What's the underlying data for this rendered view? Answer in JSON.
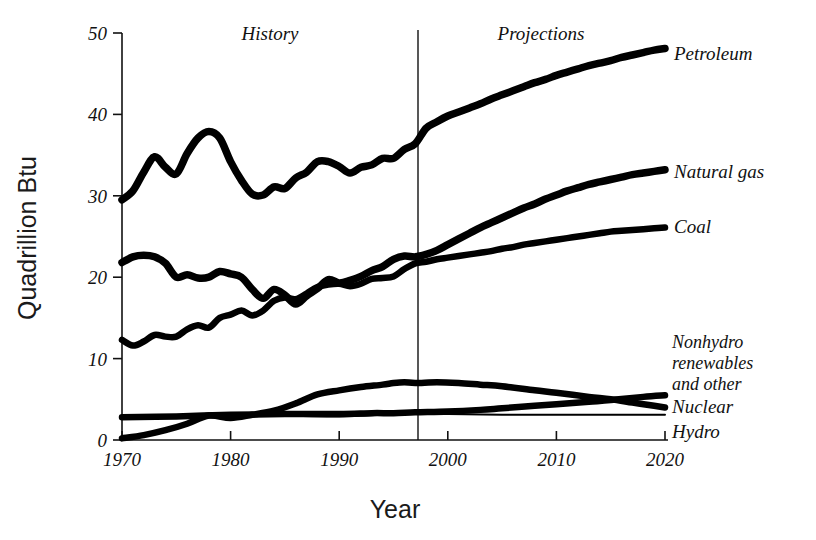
{
  "chart_data": {
    "type": "line",
    "title": "",
    "xlabel": "Year",
    "ylabel": "Quadrillion Btu",
    "xlim": [
      1970,
      2020
    ],
    "ylim": [
      0,
      50
    ],
    "xticks": [
      1970,
      1980,
      1990,
      2000,
      2010,
      2020
    ],
    "yticks": [
      0,
      10,
      20,
      30,
      40,
      50
    ],
    "xtick_labels": [
      "1970",
      "1980",
      "1990",
      "2000",
      "2010",
      "2020"
    ],
    "ytick_labels": [
      "0",
      "10",
      "20",
      "30",
      "40",
      "50"
    ],
    "grid": false,
    "legend_position": "right-inline",
    "annotations": [
      {
        "text": "History",
        "x": 1981,
        "y": 49.5
      },
      {
        "text": "Projections",
        "x": 2006,
        "y": 49.5
      }
    ],
    "divider_x": 1997,
    "series": [
      {
        "name": "Petroleum",
        "label": "Petroleum",
        "x": [
          1970,
          1971,
          1972,
          1973,
          1974,
          1975,
          1976,
          1977,
          1978,
          1979,
          1980,
          1981,
          1982,
          1983,
          1984,
          1985,
          1986,
          1987,
          1988,
          1989,
          1990,
          1991,
          1992,
          1993,
          1994,
          1995,
          1996,
          1997,
          1998,
          1999,
          2000,
          2001,
          2002,
          2003,
          2004,
          2005,
          2006,
          2007,
          2008,
          2009,
          2010,
          2011,
          2012,
          2013,
          2014,
          2015,
          2016,
          2017,
          2018,
          2019,
          2020
        ],
        "values": [
          29.5,
          30.6,
          32.9,
          34.8,
          33.5,
          32.7,
          35.2,
          37.1,
          37.9,
          37.1,
          34.2,
          31.9,
          30.2,
          30.1,
          31.1,
          30.9,
          32.2,
          32.9,
          34.2,
          34.2,
          33.6,
          32.8,
          33.5,
          33.8,
          34.6,
          34.6,
          35.7,
          36.4,
          38.3,
          39.1,
          39.8,
          40.3,
          40.8,
          41.3,
          41.9,
          42.4,
          42.9,
          43.4,
          43.9,
          44.3,
          44.8,
          45.2,
          45.6,
          46.0,
          46.3,
          46.6,
          47.0,
          47.3,
          47.6,
          47.9,
          48.1
        ]
      },
      {
        "name": "Natural gas",
        "label": "Natural gas",
        "x": [
          1970,
          1971,
          1972,
          1973,
          1974,
          1975,
          1976,
          1977,
          1978,
          1979,
          1980,
          1981,
          1982,
          1983,
          1984,
          1985,
          1986,
          1987,
          1988,
          1989,
          1990,
          1991,
          1992,
          1993,
          1994,
          1995,
          1996,
          1997,
          1998,
          1999,
          2000,
          2001,
          2002,
          2003,
          2004,
          2005,
          2006,
          2007,
          2008,
          2009,
          2010,
          2011,
          2012,
          2013,
          2014,
          2015,
          2016,
          2017,
          2018,
          2019,
          2020
        ],
        "values": [
          21.8,
          22.5,
          22.7,
          22.5,
          21.7,
          20.0,
          20.3,
          19.9,
          20.0,
          20.7,
          20.4,
          20.0,
          18.5,
          17.4,
          18.5,
          17.8,
          16.7,
          17.7,
          18.6,
          19.7,
          19.3,
          19.6,
          20.1,
          20.8,
          21.3,
          22.2,
          22.6,
          22.5,
          22.8,
          23.3,
          24.0,
          24.7,
          25.4,
          26.1,
          26.7,
          27.3,
          27.9,
          28.5,
          29.0,
          29.6,
          30.1,
          30.6,
          31.0,
          31.4,
          31.7,
          32.0,
          32.3,
          32.6,
          32.8,
          33.0,
          33.2
        ]
      },
      {
        "name": "Coal",
        "label": "Coal",
        "x": [
          1970,
          1971,
          1972,
          1973,
          1974,
          1975,
          1976,
          1977,
          1978,
          1979,
          1980,
          1981,
          1982,
          1983,
          1984,
          1985,
          1986,
          1987,
          1988,
          1989,
          1990,
          1991,
          1992,
          1993,
          1994,
          1995,
          1996,
          1997,
          1998,
          1999,
          2000,
          2001,
          2002,
          2003,
          2004,
          2005,
          2006,
          2007,
          2008,
          2009,
          2010,
          2011,
          2012,
          2013,
          2014,
          2015,
          2016,
          2017,
          2018,
          2019,
          2020
        ],
        "values": [
          12.3,
          11.6,
          12.1,
          12.9,
          12.7,
          12.7,
          13.6,
          14.1,
          13.8,
          15.0,
          15.4,
          15.9,
          15.3,
          15.9,
          17.1,
          17.5,
          17.3,
          18.0,
          18.8,
          19.1,
          19.2,
          18.9,
          19.2,
          19.8,
          19.9,
          20.1,
          21.0,
          21.7,
          21.9,
          22.2,
          22.4,
          22.6,
          22.8,
          23.0,
          23.2,
          23.5,
          23.7,
          24.0,
          24.2,
          24.4,
          24.6,
          24.8,
          25.0,
          25.2,
          25.4,
          25.6,
          25.7,
          25.8,
          25.9,
          26.0,
          26.1
        ]
      },
      {
        "name": "Nonhydro renewables and other",
        "label": "Nonhydro\nrenewables\nand other",
        "x": [
          1970,
          1975,
          1980,
          1985,
          1990,
          1993,
          1995,
          1997,
          2000,
          2003,
          2005,
          2008,
          2010,
          2013,
          2015,
          2018,
          2020
        ],
        "values": [
          2.8,
          2.9,
          3.1,
          3.2,
          3.2,
          3.3,
          3.3,
          3.4,
          3.5,
          3.7,
          3.9,
          4.2,
          4.4,
          4.7,
          4.9,
          5.3,
          5.5
        ]
      },
      {
        "name": "Nuclear",
        "label": "Nuclear",
        "x": [
          1970,
          1972,
          1974,
          1976,
          1978,
          1980,
          1982,
          1984,
          1986,
          1988,
          1990,
          1992,
          1994,
          1995,
          1996,
          1997,
          1999,
          2001,
          2003,
          2005,
          2008,
          2010,
          2013,
          2015,
          2017,
          2019,
          2020
        ],
        "values": [
          0.2,
          0.6,
          1.2,
          2.0,
          3.0,
          2.7,
          3.1,
          3.6,
          4.5,
          5.6,
          6.1,
          6.5,
          6.8,
          7.0,
          7.1,
          7.0,
          7.1,
          7.0,
          6.8,
          6.6,
          6.1,
          5.8,
          5.3,
          5.0,
          4.6,
          4.2,
          4.0
        ]
      },
      {
        "name": "Hydro",
        "label": "Hydro",
        "x": [
          1970,
          1975,
          1980,
          1985,
          1990,
          1995,
          1997,
          2000,
          2005,
          2010,
          2015,
          2020
        ],
        "values": [
          2.8,
          3.0,
          3.1,
          3.0,
          2.9,
          3.2,
          3.3,
          3.2,
          3.1,
          3.1,
          3.1,
          3.1
        ]
      }
    ]
  },
  "axes": {
    "ylabel": "Quadrillion Btu",
    "xlabel": "Year"
  },
  "labels": {
    "history": "History",
    "projections": "Projections",
    "petroleum": "Petroleum",
    "natural_gas": "Natural gas",
    "coal": "Coal",
    "nonhydro_line1": "Nonhydro",
    "nonhydro_line2": "renewables",
    "nonhydro_line3": "and other",
    "nuclear": "Nuclear",
    "hydro": "Hydro"
  },
  "ticks": {
    "y": [
      "50",
      "40",
      "30",
      "20",
      "10",
      "0"
    ],
    "x": [
      "1970",
      "1980",
      "1990",
      "2000",
      "2010",
      "2020"
    ]
  },
  "colors": {
    "ink": "#000000",
    "background": "#ffffff"
  }
}
